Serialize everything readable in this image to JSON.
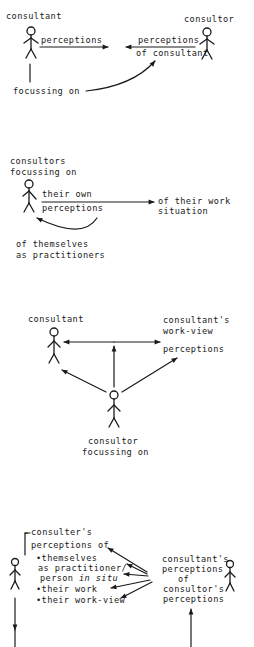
{
  "panel1": {
    "consultant_label": "consultant",
    "consultor_label": "consultor",
    "perceptions_label": "perceptions",
    "perceptions_of_consultant_line1": "perceptions",
    "perceptions_of_consultant_line2": "of consultant",
    "focussing_on_label": "focussing on"
  },
  "panel2": {
    "consultors_label_line1": "consultors",
    "consultors_label_line2": "focussing on",
    "their_own_line1": "their own",
    "their_own_line2": "perceptions",
    "work_situation_line1": "of their work",
    "work_situation_line2": "situation",
    "themselves_line1": "of themselves",
    "themselves_line2": "as practitioners"
  },
  "panel3": {
    "consultant_label": "consultant",
    "workview_line1": "consultant's",
    "workview_line2": "work-view",
    "workview_line3": "perceptions",
    "consultor_line1": "consultor",
    "consultor_line2": "focussing on"
  },
  "panel4": {
    "left_heading_line1": "consulter's",
    "left_heading_line2": "perceptions of",
    "bullets": [
      {
        "line1": "•themselves",
        "line2": "as practitioner/",
        "line3_plain": "person ",
        "line3_italic": "in situ"
      },
      {
        "line1": "•their work"
      },
      {
        "line1": "•their work-view"
      }
    ],
    "right_line1": "consultant's",
    "right_line2": "perceptions",
    "right_line3": "of",
    "right_line4": "consultor's",
    "right_line5": "perceptions"
  }
}
